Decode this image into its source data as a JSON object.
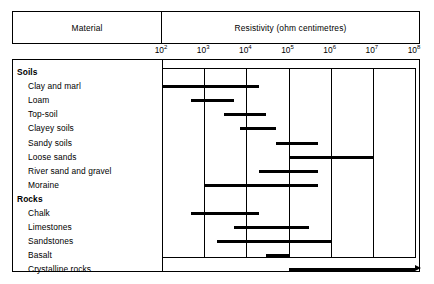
{
  "header": {
    "material_label": "Material",
    "resistivity_label": "Resistivity (ohm centimetres)"
  },
  "groups": [
    {
      "label": "Soils"
    },
    {
      "label": "Rocks"
    }
  ],
  "chart_data": {
    "type": "bar",
    "orientation": "horizontal",
    "title": "Resistivity (ohm centimetres)",
    "xlabel": "Resistivity (ohm centimetres)",
    "ylabel": "Material",
    "xscale": "log",
    "xlim": [
      100,
      100000000
    ],
    "xtick_labels": [
      "10²",
      "10³",
      "10⁴",
      "10⁵",
      "10⁶",
      "10⁷",
      "10⁸"
    ],
    "xticks": [
      100,
      1000,
      10000,
      100000,
      1000000,
      10000000,
      100000000
    ],
    "grid": true,
    "legend": "none",
    "categories": [
      "Clay and marl",
      "Loam",
      "Top-soil",
      "Clayey soils",
      "Sandy soils",
      "Loose sands",
      "River sand and gravel",
      "Moraine",
      "Chalk",
      "Limestones",
      "Sandstones",
      "Basalt",
      "Crystalline rocks"
    ],
    "ranges": [
      {
        "category": "Clay and marl",
        "group": "Soils",
        "low": 100,
        "high": 20000,
        "open_ended": false
      },
      {
        "category": "Loam",
        "group": "Soils",
        "low": 500,
        "high": 5000,
        "open_ended": false
      },
      {
        "category": "Top-soil",
        "group": "Soils",
        "low": 3000,
        "high": 30000,
        "open_ended": false
      },
      {
        "category": "Clayey soils",
        "group": "Soils",
        "low": 7000,
        "high": 50000,
        "open_ended": false
      },
      {
        "category": "Sandy soils",
        "group": "Soils",
        "low": 50000,
        "high": 500000,
        "open_ended": false
      },
      {
        "category": "Loose sands",
        "group": "Soils",
        "low": 100000,
        "high": 10000000,
        "open_ended": false
      },
      {
        "category": "River sand and gravel",
        "group": "Soils",
        "low": 20000,
        "high": 500000,
        "open_ended": false
      },
      {
        "category": "Moraine",
        "group": "Soils",
        "low": 1000,
        "high": 500000,
        "open_ended": false
      },
      {
        "category": "Chalk",
        "group": "Rocks",
        "low": 500,
        "high": 20000,
        "open_ended": false
      },
      {
        "category": "Limestones",
        "group": "Rocks",
        "low": 5000,
        "high": 300000,
        "open_ended": false
      },
      {
        "category": "Sandstones",
        "group": "Rocks",
        "low": 2000,
        "high": 1000000,
        "open_ended": false
      },
      {
        "category": "Basalt",
        "group": "Rocks",
        "low": 30000,
        "high": 100000,
        "open_ended": false
      },
      {
        "category": "Crystalline rocks",
        "group": "Rocks",
        "low": 100000,
        "high": 100000000,
        "open_ended": true
      }
    ]
  },
  "colors": {
    "bar": "#000000",
    "frame": "#000000",
    "background": "#ffffff"
  }
}
